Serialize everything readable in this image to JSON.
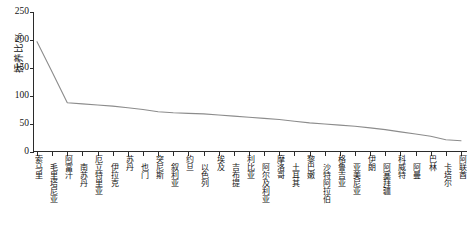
{
  "chart_data": {
    "type": "line",
    "title": "",
    "xlabel": "",
    "ylabel": "抚养比/%",
    "ylim": [
      0,
      250
    ],
    "yticks": [
      0,
      50,
      100,
      150,
      200,
      250
    ],
    "grid": false,
    "legend": "none",
    "categories": [
      "索马里",
      "毛里塔尼亚",
      "阿富汗",
      "南苏丹",
      "厄立特里亚",
      "伊拉克",
      "苏丹",
      "也门",
      "突尼斯",
      "叙利亚",
      "约旦",
      "以色列",
      "埃及",
      "吉布提",
      "利比亚",
      "阿尔及利亚",
      "摩洛哥",
      "土耳其",
      "黎巴嫩",
      "沙特阿拉伯",
      "格鲁吉亚",
      "亚美尼亚",
      "伊朗",
      "阿塞拜疆",
      "科威特",
      "阿曼",
      "巴林",
      "卡塔尔",
      "阿联酋"
    ],
    "values": [
      197,
      143,
      88,
      86,
      84,
      82,
      79,
      76,
      72,
      70,
      69,
      68,
      66,
      64,
      62,
      60,
      58,
      55,
      52,
      50,
      48,
      46,
      43,
      40,
      36,
      32,
      28,
      22,
      20
    ],
    "series": [
      {
        "name": "抚养比",
        "color": "#8c8c8c",
        "values": [
          197,
          143,
          88,
          86,
          84,
          82,
          79,
          76,
          72,
          70,
          69,
          68,
          66,
          64,
          62,
          60,
          58,
          55,
          52,
          50,
          48,
          46,
          43,
          40,
          36,
          32,
          28,
          22,
          20
        ]
      }
    ]
  },
  "axis": {
    "y_label": "抚养比/%",
    "y_ticks": [
      "0",
      "50",
      "100",
      "150",
      "200",
      "250"
    ]
  },
  "colors": {
    "line": "#8c8c8c",
    "axis": "#2b2b2b",
    "text": "#141414",
    "background": "#ffffff"
  }
}
